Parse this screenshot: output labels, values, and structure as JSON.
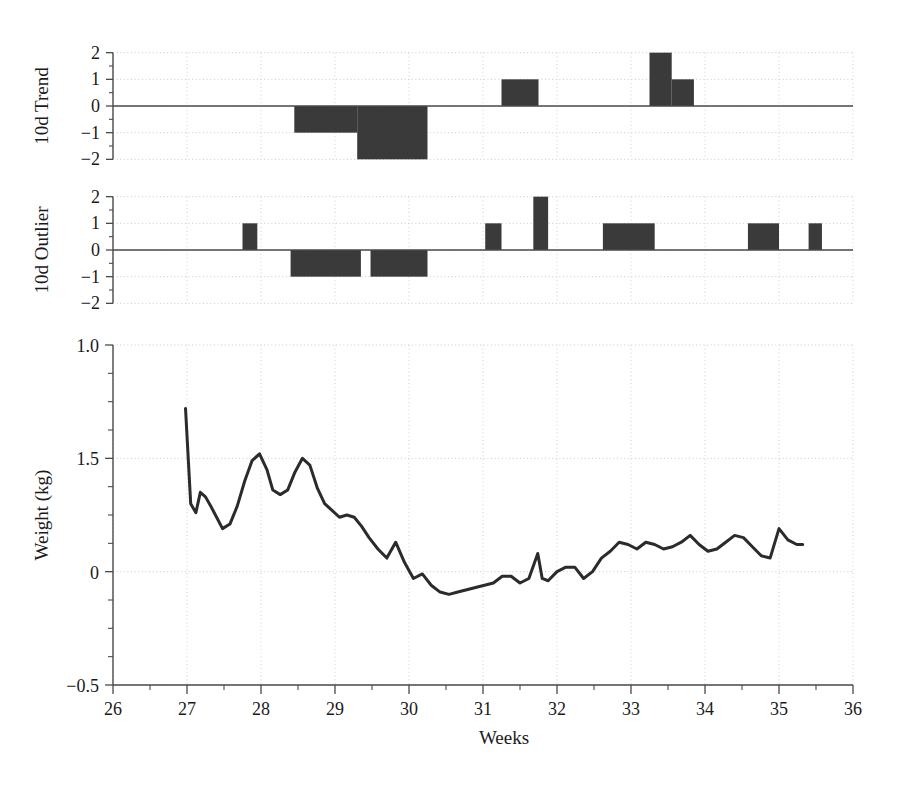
{
  "figure": {
    "width": 908,
    "height": 787,
    "background": "#ffffff",
    "ink_color": "#3a3a3a",
    "line_color": "#2b2b2b",
    "grid_color": "#c9c9c9"
  },
  "axes": {
    "xlabel": "Weeks",
    "xticks": [
      26,
      27,
      28,
      29,
      30,
      31,
      32,
      33,
      34,
      35,
      36
    ],
    "xticklabels": [
      "26",
      "27",
      "28",
      "29",
      "30",
      "31",
      "32",
      "33",
      "34",
      "35",
      "36"
    ],
    "xlim": [
      26,
      36
    ],
    "xminor_step": 0.5
  },
  "chart_data": [
    {
      "type": "bar",
      "title": "",
      "panel": "top",
      "ylabel": "10d Trend",
      "xlabel": "",
      "ylim": [
        -2.4,
        2.4
      ],
      "yticks": [
        2,
        1,
        0,
        -1,
        -2
      ],
      "yticklabels": [
        "2",
        "1",
        "0",
        "−1",
        "−2"
      ],
      "grid": true,
      "x": [
        26.0,
        28.45,
        29.3,
        30.25,
        31.25,
        31.75,
        33.25,
        33.55,
        33.85,
        36.0
      ],
      "values": [
        0,
        -1,
        -2,
        0,
        1,
        0,
        2,
        1,
        0,
        0
      ],
      "step_style": "post",
      "segments": [
        {
          "x0": 28.45,
          "x1": 29.3,
          "value": -1
        },
        {
          "x0": 29.3,
          "x1": 30.25,
          "value": -2
        },
        {
          "x0": 31.25,
          "x1": 31.75,
          "value": 1
        },
        {
          "x0": 33.25,
          "x1": 33.55,
          "value": 2
        },
        {
          "x0": 33.55,
          "x1": 33.85,
          "value": 1
        }
      ]
    },
    {
      "type": "bar",
      "title": "",
      "panel": "middle",
      "ylabel": "10d Outlier",
      "xlabel": "",
      "ylim": [
        -2.4,
        2.4
      ],
      "yticks": [
        2,
        1,
        0,
        -1,
        -2
      ],
      "yticklabels": [
        "2",
        "1",
        "0",
        "−1",
        "−2"
      ],
      "grid": true,
      "step_style": "post",
      "segments": [
        {
          "x0": 27.75,
          "x1": 27.95,
          "value": 1
        },
        {
          "x0": 28.4,
          "x1": 29.35,
          "value": -1
        },
        {
          "x0": 29.48,
          "x1": 30.25,
          "value": -1
        },
        {
          "x0": 31.03,
          "x1": 31.25,
          "value": 1
        },
        {
          "x0": 31.68,
          "x1": 31.88,
          "value": 2
        },
        {
          "x0": 32.62,
          "x1": 33.32,
          "value": 1
        },
        {
          "x0": 34.58,
          "x1": 35.0,
          "value": 1
        },
        {
          "x0": 35.4,
          "x1": 35.58,
          "value": 1
        }
      ]
    },
    {
      "type": "line",
      "title": "",
      "panel": "bottom",
      "ylabel": "Weight (kg)",
      "xlabel": "Weeks",
      "yticks_positions": [
        1.0,
        0.5,
        0.0,
        -0.5
      ],
      "yticklabels": [
        "1.0",
        "1.5",
        "0",
        "−0.5"
      ],
      "ylim": [
        -0.5,
        1.0
      ],
      "grid": true,
      "series_name": "Weight",
      "x": [
        26.98,
        27.05,
        27.12,
        27.18,
        27.25,
        27.32,
        27.4,
        27.48,
        27.58,
        27.68,
        27.78,
        27.88,
        27.98,
        28.08,
        28.16,
        28.26,
        28.36,
        28.46,
        28.56,
        28.66,
        28.76,
        28.86,
        28.96,
        29.06,
        29.16,
        29.26,
        29.36,
        29.46,
        29.58,
        29.7,
        29.82,
        29.94,
        30.06,
        30.18,
        30.3,
        30.42,
        30.54,
        30.66,
        30.78,
        30.9,
        31.02,
        31.14,
        31.26,
        31.38,
        31.5,
        31.62,
        31.74,
        31.8,
        31.88,
        32.0,
        32.12,
        32.24,
        32.36,
        32.48,
        32.6,
        32.72,
        32.84,
        32.96,
        33.08,
        33.2,
        33.32,
        33.44,
        33.56,
        33.68,
        33.8,
        33.92,
        34.04,
        34.16,
        34.28,
        34.4,
        34.52,
        34.64,
        34.76,
        34.88,
        35.0,
        35.12,
        35.24,
        35.32
      ],
      "values": [
        0.72,
        0.3,
        0.26,
        0.35,
        0.33,
        0.29,
        0.24,
        0.19,
        0.21,
        0.29,
        0.4,
        0.49,
        0.52,
        0.45,
        0.36,
        0.34,
        0.36,
        0.44,
        0.5,
        0.47,
        0.37,
        0.3,
        0.27,
        0.24,
        0.25,
        0.24,
        0.2,
        0.15,
        0.1,
        0.06,
        0.13,
        0.04,
        -0.03,
        -0.01,
        -0.06,
        -0.09,
        -0.1,
        -0.09,
        -0.08,
        -0.07,
        -0.06,
        -0.05,
        -0.02,
        -0.02,
        -0.05,
        -0.03,
        0.08,
        -0.03,
        -0.04,
        0.0,
        0.02,
        0.02,
        -0.03,
        0.0,
        0.06,
        0.09,
        0.13,
        0.12,
        0.1,
        0.13,
        0.12,
        0.1,
        0.11,
        0.13,
        0.16,
        0.12,
        0.09,
        0.1,
        0.13,
        0.16,
        0.15,
        0.11,
        0.07,
        0.06,
        0.19,
        0.14,
        0.12,
        0.12
      ]
    }
  ]
}
